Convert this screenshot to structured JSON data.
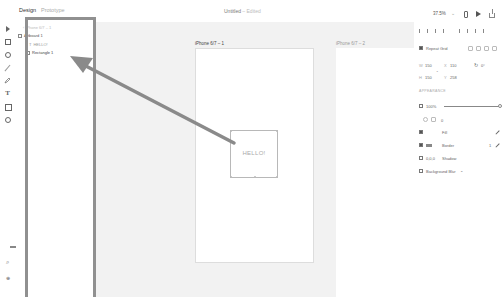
{
  "topbar": {
    "tabs": [
      {
        "label": "Design",
        "active": true
      },
      {
        "label": "Prototype",
        "active": false
      }
    ],
    "document_title": "Untitled",
    "document_status": "– Edited",
    "zoom_level": "37.5%",
    "zoom_chevron": "⌄"
  },
  "toolbar": {
    "tools": [
      "select",
      "rectangle",
      "ellipse",
      "line",
      "pen",
      "text",
      "artboard",
      "zoom"
    ],
    "text_tool_glyph": "T",
    "plugins_glyph": "⌕",
    "settings_glyph": "⊕"
  },
  "layers": {
    "header": "‹ iPhone 6/7 – 1",
    "items": [
      {
        "label": "Artboard 1",
        "type": "artboard"
      },
      {
        "label": "HELLO!",
        "type": "text"
      },
      {
        "label": "Rectangle 1",
        "type": "rectangle",
        "selected": true
      }
    ]
  },
  "canvas": {
    "artboards": [
      {
        "label": "iPhone 6/7 – 1"
      },
      {
        "label": "iPhone 6/7 – 2"
      }
    ],
    "selected_element_text": "HELLO!"
  },
  "annotation": {
    "arrow_color": "#8a8a8a",
    "highlight_color": "#909090"
  },
  "properties": {
    "repeat_grid_label": "Repeat Grid",
    "width_label": "W",
    "width_value": "150",
    "x_label": "X",
    "x_value": "110",
    "rotation_value": "0°",
    "height_label": "H",
    "height_value": "150",
    "y_label": "Y",
    "y_value": "258",
    "appearance_header": "APPEARANCE",
    "opacity_value": "100%",
    "corner_radius_value": "0",
    "fill_label": "Fill",
    "border_label": "Border",
    "border_width": "1",
    "shadow_label": "Shadow",
    "shadow_value": "0,0,0",
    "background_blur_label": "Background Blur",
    "background_blur_chevron": "⌄"
  }
}
